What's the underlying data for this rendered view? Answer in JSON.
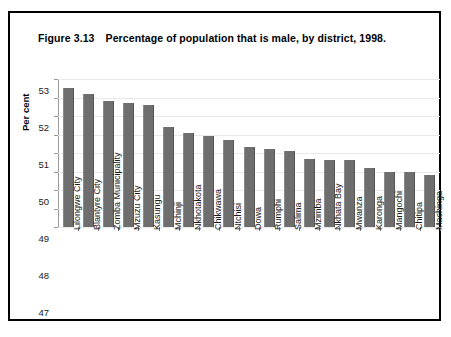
{
  "figure": {
    "number": "Figure 3.13",
    "title": "Percentage of population that is male, by district, 1998."
  },
  "colors": {
    "bar_fill": "#6e6e6e",
    "frame": "#000000",
    "gridline": "#e9e9e9",
    "axis": "#7d7d7d"
  },
  "chart_data": {
    "type": "bar",
    "title": "Percentage of population that is male, by district, 1998.",
    "xlabel": "",
    "ylabel": "Per cent",
    "ylim": [
      45,
      53
    ],
    "ytick_step": 1,
    "yticks": [
      53,
      52,
      51,
      50,
      49,
      48,
      47,
      46,
      45
    ],
    "ytick_labels": [
      "53",
      "52",
      "51",
      "50",
      "49",
      "48",
      "47",
      "46",
      "45"
    ],
    "grid": true,
    "legend": false,
    "categories": [
      "Lilongwe City",
      "Blantyre City",
      "Zomba Municipality",
      "Mzuzu City",
      "Kasungu",
      "Mchinji",
      "Nkhotakota",
      "Chikwawa",
      "Ntchisi",
      "Dowa",
      "Rumphi",
      "Salima",
      "Mzimba",
      "Nkhata Bay",
      "Mwanza",
      "Karonga",
      "Mangochi",
      "Chitipa",
      "Machinga"
    ],
    "values": [
      52.5,
      52.2,
      51.8,
      51.7,
      51.6,
      50.4,
      50.1,
      49.9,
      49.7,
      49.3,
      49.2,
      49.1,
      48.7,
      48.6,
      48.6,
      48.2,
      48.0,
      48.0,
      47.8
    ]
  }
}
